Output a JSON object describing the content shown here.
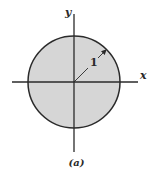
{
  "figure": {
    "caption": "(a)",
    "axes": {
      "x_label": "x",
      "y_label": "y"
    },
    "circle": {
      "radius_label": "1",
      "fill_color": "#d6d6d6",
      "stroke_color": "#2a2a2a"
    }
  }
}
